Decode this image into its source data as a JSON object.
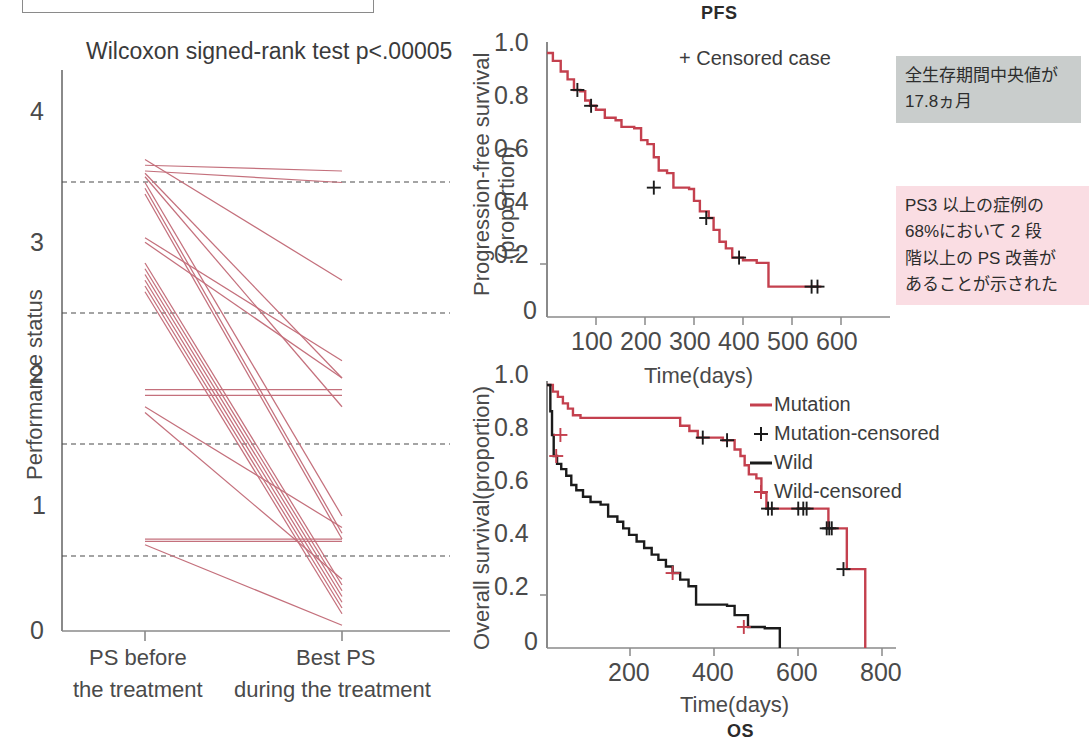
{
  "figure": {
    "panels": [
      "ps-spaghetti",
      "pfs-km",
      "os-km"
    ]
  },
  "left_panel": {
    "annotation": "Wilcoxon signed-rank test p<.00005",
    "y_axis_label": "Performance status",
    "y_ticks": [
      "0",
      "1",
      "2",
      "3",
      "4"
    ],
    "x_tick_labels": [
      {
        "line1": "PS before",
        "line2": "the treatment"
      },
      {
        "line1": "Best PS",
        "line2": "during the treatment"
      }
    ]
  },
  "pfs_panel": {
    "title": "PFS",
    "legend": "+ Censored case",
    "y_axis_label_1": "Progression-free survival",
    "y_axis_label_2": "(proportion)",
    "x_axis_label": "Time(days)",
    "y_ticks": [
      "0",
      "0.2",
      "0.4",
      "0.6",
      "0.8",
      "1.0"
    ],
    "x_ticks": [
      "100",
      "200",
      "300",
      "400",
      "500",
      "600"
    ]
  },
  "os_panel": {
    "title": "OS",
    "y_axis_label": "Overall survival(proportion)",
    "x_axis_label": "Time(days)",
    "y_ticks": [
      "0",
      "0.2",
      "0.4",
      "0.6",
      "0.8",
      "1.0"
    ],
    "x_ticks": [
      "200",
      "400",
      "600",
      "800"
    ],
    "legend": [
      {
        "label": "Mutation",
        "marker": "line",
        "color": "#c4404e"
      },
      {
        "label": "Mutation-censored",
        "marker": "plus",
        "color": "#1b1b1b"
      },
      {
        "label": "Wild",
        "marker": "line",
        "color": "#1b1b1b"
      },
      {
        "label": "Wild-censored",
        "marker": "plus",
        "color": "#c4404e"
      }
    ]
  },
  "notes": {
    "grey": "全生存期間中央値が\n17.8ヵ月",
    "pink": "PS3 以上の症例の\n68%において 2 段\n階以上の PS 改善が\nあることが示された"
  },
  "colors": {
    "red": "#c4404e",
    "black": "#1b1b1b",
    "axis": "#8a8a8a",
    "grey_note_bg": "#c9cdcc",
    "pink_note_bg": "#fadde3"
  },
  "chart_data": [
    {
      "type": "line",
      "name": "ps-before-after-paired",
      "title": "Wilcoxon signed-rank test p<.00005",
      "xlabel": "",
      "ylabel": "Performance status",
      "categories": [
        "PS before the treatment",
        "Best PS during the treatment"
      ],
      "ylim": [
        0,
        4.2
      ],
      "grid": "dashed horizontal lines at 0.55, 1.55, 2.5, 3.48",
      "gridlines": [
        0.55,
        1.55,
        2.5,
        3.48
      ],
      "series": [
        {
          "name": "case1",
          "values": [
            4.1,
            3.05
          ]
        },
        {
          "name": "case2",
          "values": [
            4.05,
            4.0
          ]
        },
        {
          "name": "case3",
          "values": [
            4.0,
            3.9
          ]
        },
        {
          "name": "case4",
          "values": [
            3.98,
            2.2
          ]
        },
        {
          "name": "case5",
          "values": [
            3.95,
            1.95
          ]
        },
        {
          "name": "case6",
          "values": [
            3.9,
            1.0
          ]
        },
        {
          "name": "case7",
          "values": [
            3.85,
            0.85
          ]
        },
        {
          "name": "case8",
          "values": [
            3.8,
            0.8
          ]
        },
        {
          "name": "case9",
          "values": [
            3.42,
            2.35
          ]
        },
        {
          "name": "case10",
          "values": [
            3.38,
            2.2
          ]
        },
        {
          "name": "case11",
          "values": [
            3.2,
            0.4
          ]
        },
        {
          "name": "case12",
          "values": [
            3.15,
            0.35
          ]
        },
        {
          "name": "case13",
          "values": [
            3.1,
            0.3
          ]
        },
        {
          "name": "case14",
          "values": [
            3.05,
            0.25
          ]
        },
        {
          "name": "case15",
          "values": [
            3.0,
            0.2
          ]
        },
        {
          "name": "case16",
          "values": [
            2.95,
            0.15
          ]
        },
        {
          "name": "case17",
          "values": [
            2.1,
            2.1
          ]
        },
        {
          "name": "case18",
          "values": [
            2.05,
            2.05
          ]
        },
        {
          "name": "case19",
          "values": [
            1.95,
            0.9
          ]
        },
        {
          "name": "case20",
          "values": [
            1.9,
            0.45
          ]
        },
        {
          "name": "case21",
          "values": [
            0.8,
            0.8
          ]
        },
        {
          "name": "case22",
          "values": [
            0.78,
            0.78
          ]
        },
        {
          "name": "case23",
          "values": [
            0.75,
            0.05
          ]
        }
      ]
    },
    {
      "type": "line",
      "name": "pfs-kaplan-meier",
      "title": "PFS",
      "xlabel": "Time(days)",
      "ylabel": "Progression-free survival (proportion)",
      "xlim": [
        0,
        620
      ],
      "ylim": [
        0,
        1.0
      ],
      "legend": "+ Censored case",
      "legend_position": "upper-right",
      "grid": false,
      "series": [
        {
          "name": "PFS",
          "color": "#c4404e",
          "step": [
            [
              0,
              1.0
            ],
            [
              12,
              0.97
            ],
            [
              28,
              0.93
            ],
            [
              42,
              0.9
            ],
            [
              55,
              0.86
            ],
            [
              68,
              0.855
            ],
            [
              78,
              0.82
            ],
            [
              88,
              0.8
            ],
            [
              100,
              0.785
            ],
            [
              118,
              0.755
            ],
            [
              140,
              0.745
            ],
            [
              152,
              0.72
            ],
            [
              178,
              0.715
            ],
            [
              192,
              0.67
            ],
            [
              205,
              0.655
            ],
            [
              218,
              0.605
            ],
            [
              228,
              0.555
            ],
            [
              245,
              0.545
            ],
            [
              258,
              0.49
            ],
            [
              290,
              0.485
            ],
            [
              300,
              0.44
            ],
            [
              312,
              0.4
            ],
            [
              330,
              0.375
            ],
            [
              340,
              0.33
            ],
            [
              352,
              0.285
            ],
            [
              365,
              0.26
            ],
            [
              378,
              0.225
            ],
            [
              400,
              0.215
            ],
            [
              428,
              0.205
            ],
            [
              452,
              0.115
            ],
            [
              560,
              0.115
            ]
          ],
          "censored": [
            [
              62,
              0.86
            ],
            [
              90,
              0.8
            ],
            [
              218,
              0.49
            ],
            [
              325,
              0.375
            ],
            [
              392,
              0.225
            ],
            [
              540,
              0.115
            ],
            [
              552,
              0.115
            ]
          ]
        }
      ]
    },
    {
      "type": "line",
      "name": "os-kaplan-meier-by-mutation",
      "title": "OS",
      "xlabel": "Time(days)",
      "ylabel": "Overall survival(proportion)",
      "xlim": [
        0,
        830
      ],
      "ylim": [
        0,
        1.0
      ],
      "legend_position": "upper-right",
      "grid": false,
      "series": [
        {
          "name": "Mutation",
          "color": "#c4404e",
          "step": [
            [
              0,
              1.0
            ],
            [
              14,
              0.975
            ],
            [
              26,
              0.955
            ],
            [
              38,
              0.93
            ],
            [
              50,
              0.91
            ],
            [
              62,
              0.885
            ],
            [
              80,
              0.875
            ],
            [
              300,
              0.875
            ],
            [
              318,
              0.845
            ],
            [
              340,
              0.825
            ],
            [
              360,
              0.8
            ],
            [
              420,
              0.79
            ],
            [
              448,
              0.755
            ],
            [
              462,
              0.73
            ],
            [
              472,
              0.695
            ],
            [
              482,
              0.66
            ],
            [
              500,
              0.645
            ],
            [
              512,
              0.59
            ],
            [
              524,
              0.53
            ],
            [
              660,
              0.53
            ],
            [
              672,
              0.455
            ],
            [
              716,
              0.455
            ],
            [
              716,
              0.3
            ],
            [
              760,
              0.3
            ],
            [
              760,
              0.0
            ]
          ],
          "censored": [
            [
              372,
              0.8
            ],
            [
              430,
              0.79
            ],
            [
              528,
              0.53
            ],
            [
              537,
              0.53
            ],
            [
              600,
              0.53
            ],
            [
              612,
              0.53
            ],
            [
              620,
              0.53
            ],
            [
              668,
              0.455
            ],
            [
              674,
              0.455
            ],
            [
              680,
              0.455
            ],
            [
              708,
              0.3
            ]
          ]
        },
        {
          "name": "Wild",
          "color": "#1b1b1b",
          "step": [
            [
              0,
              1.0
            ],
            [
              8,
              0.9
            ],
            [
              12,
              0.81
            ],
            [
              16,
              0.73
            ],
            [
              24,
              0.7
            ],
            [
              34,
              0.68
            ],
            [
              46,
              0.655
            ],
            [
              58,
              0.62
            ],
            [
              70,
              0.6
            ],
            [
              86,
              0.575
            ],
            [
              104,
              0.555
            ],
            [
              128,
              0.545
            ],
            [
              146,
              0.5
            ],
            [
              168,
              0.48
            ],
            [
              182,
              0.455
            ],
            [
              196,
              0.43
            ],
            [
              214,
              0.405
            ],
            [
              232,
              0.38
            ],
            [
              250,
              0.355
            ],
            [
              266,
              0.335
            ],
            [
              284,
              0.31
            ],
            [
              300,
              0.285
            ],
            [
              318,
              0.26
            ],
            [
              338,
              0.235
            ],
            [
              356,
              0.165
            ],
            [
              430,
              0.16
            ],
            [
              448,
              0.125
            ],
            [
              480,
              0.08
            ],
            [
              520,
              0.075
            ],
            [
              556,
              0.075
            ],
            [
              556,
              0.0
            ]
          ],
          "censored": [
            [
              32,
              0.81
            ],
            [
              22,
              0.73
            ],
            [
              300,
              0.285
            ],
            [
              470,
              0.08
            ]
          ]
        }
      ]
    }
  ]
}
